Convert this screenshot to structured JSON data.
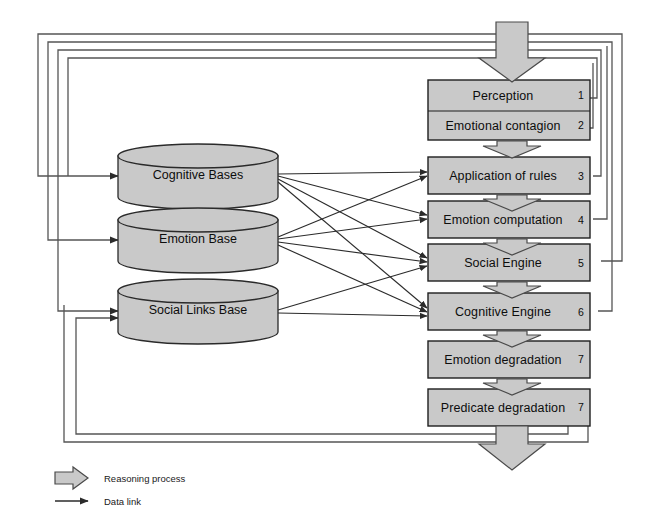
{
  "diagram": {
    "colors": {
      "box_fill": "#c9c9c9",
      "box_stroke": "#1f1f1f",
      "cylinder_fill": "#c9c9c9",
      "cylinder_stroke": "#2a2a2a",
      "arrow_fill": "#c9c9c9",
      "arrow_stroke": "#4a4a4a",
      "link_stroke": "#2b2b2b",
      "feedback_stroke": "#555555",
      "background": "#ffffff"
    }
  },
  "process_boxes": [
    {
      "id": "perception",
      "label": "Perception",
      "number": "1"
    },
    {
      "id": "emotional-contagion",
      "label": "Emotional contagion",
      "number": "2"
    },
    {
      "id": "application-of-rules",
      "label": "Application of rules",
      "number": "3"
    },
    {
      "id": "emotion-computation",
      "label": "Emotion computation",
      "number": "4"
    },
    {
      "id": "social-engine",
      "label": "Social Engine",
      "number": "5"
    },
    {
      "id": "cognitive-engine",
      "label": "Cognitive Engine",
      "number": "6"
    },
    {
      "id": "emotion-degradation",
      "label": "Emotion degradation",
      "number": "7"
    },
    {
      "id": "predicate-degradation",
      "label": "Predicate degradation",
      "number": "7"
    }
  ],
  "data_stores": [
    {
      "id": "cognitive-bases",
      "label": "Cognitive Bases"
    },
    {
      "id": "emotion-base",
      "label": "Emotion Base"
    },
    {
      "id": "social-links-base",
      "label": "Social Links Base"
    }
  ],
  "legend": [
    {
      "id": "reasoning-process",
      "label": "Reasoning process",
      "symbol": "block-arrow"
    },
    {
      "id": "data-link",
      "label": "Data link",
      "symbol": "thin-arrow"
    }
  ]
}
